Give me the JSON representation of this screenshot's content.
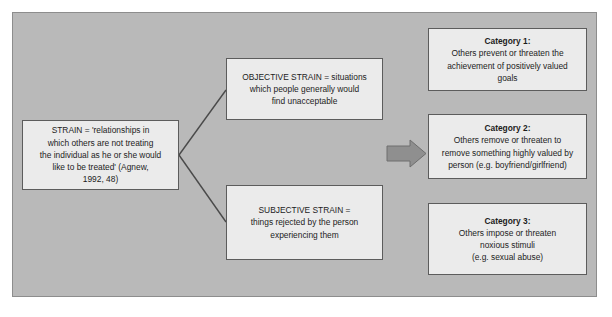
{
  "diagram": {
    "colors": {
      "panel_background": "#b9b9b9",
      "panel_border": "#8d8d8d",
      "node_background": "#ebebeb",
      "node_border": "#5c5c5c",
      "connector": "#4a4a4a",
      "arrow_fill": "#8f8f8f",
      "arrow_stroke": "#6e6e6e",
      "text": "#1c1c1c"
    },
    "nodes": {
      "strain": {
        "name": "strain-definition",
        "lines": [
          "STRAIN = 'relationships in",
          "which others are not treating",
          "the individual as he or she would",
          "like to be treated' (Agnew,",
          "1992, 48)"
        ]
      },
      "objective": {
        "name": "objective-strain",
        "lines": [
          "OBJECTIVE STRAIN = situations",
          "which people generally would",
          "find unacceptable"
        ]
      },
      "subjective": {
        "name": "subjective-strain",
        "lines": [
          "SUBJECTIVE STRAIN =",
          "things rejected by the person",
          "experiencing them"
        ]
      },
      "category1": {
        "name": "category-1",
        "heading": "Category 1:",
        "lines": [
          "Others prevent or threaten the",
          "achievement of positively valued",
          "goals"
        ]
      },
      "category2": {
        "name": "category-2",
        "heading": "Category 2:",
        "lines": [
          "Others remove or threaten to",
          "remove something highly valued by",
          "person (e.g. boyfriend/girlfriend)"
        ]
      },
      "category3": {
        "name": "category-3",
        "heading": "Category 3:",
        "lines": [
          "Others impose or threaten",
          "noxious stimuli",
          "(e.g. sexual abuse)"
        ]
      }
    },
    "connectors": [
      {
        "name": "strain-to-objective-line",
        "from": "strain",
        "to": "objective",
        "style": "diagonal-line"
      },
      {
        "name": "strain-to-subjective-line",
        "from": "strain",
        "to": "subjective",
        "style": "diagonal-line"
      },
      {
        "name": "middle-to-categories-arrow",
        "from": "middle-column",
        "to": "categories-column",
        "style": "block-arrow-right"
      }
    ]
  }
}
